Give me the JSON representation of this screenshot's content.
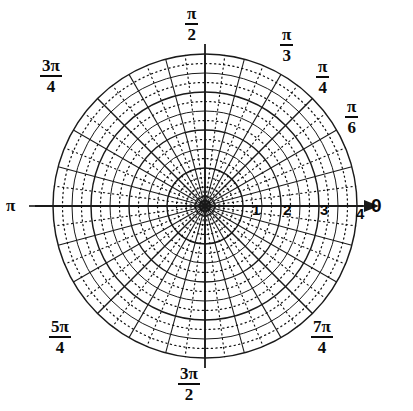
{
  "figure": {
    "kind": "polar-grid",
    "title": "",
    "background_color": "#ffffff",
    "line_color": "#1a1a1a",
    "dot_color": "#111111",
    "center_x": 205,
    "center_y": 206,
    "outer_radius_px": 152
  },
  "chart_data": {
    "type": "scatter",
    "title": "",
    "xlabel": "",
    "ylabel": "",
    "grid": true,
    "legend": null,
    "coordinate_system": "polar",
    "series": [],
    "x": [],
    "values": [],
    "radial_axis": {
      "label": "",
      "rlim": [
        0,
        4
      ],
      "major_ticks": [
        1,
        2,
        3,
        4
      ],
      "tick_labels": [
        "1",
        "2",
        "3",
        "4"
      ],
      "minor_solid_step": 0.5,
      "dotted_step": 0.25,
      "tick_label_angle_deg": 0
    },
    "angular_axis": {
      "label": "",
      "direction": "counterclockwise",
      "zero_location": "E",
      "solid_spoke_step": "pi/12",
      "dotted_spoke_step": "pi/24",
      "tick_labels": [
        "0",
        "pi/6",
        "pi/4",
        "pi/3",
        "pi/2",
        "3pi/4",
        "pi",
        "5pi/4",
        "3pi/2",
        "7pi/4"
      ]
    },
    "annotations": [
      {
        "name": "polar-axis-arrow",
        "text": "",
        "angle_deg": 0,
        "radius": 4.35
      }
    ]
  },
  "angle_labels": [
    {
      "id": "zero",
      "text": "0",
      "num": "",
      "den": "",
      "kind": "plain",
      "angle_deg": 0,
      "left": 371,
      "top": 196
    },
    {
      "id": "pi-over-6",
      "text": "",
      "num": "π",
      "den": "6",
      "kind": "fraction",
      "angle_deg": 30,
      "left": 345,
      "top": 98
    },
    {
      "id": "pi-over-4",
      "text": "",
      "num": "π",
      "den": "4",
      "kind": "fraction",
      "angle_deg": 45,
      "left": 316,
      "top": 58
    },
    {
      "id": "pi-over-3",
      "text": "",
      "num": "π",
      "den": "3",
      "kind": "fraction",
      "angle_deg": 60,
      "left": 280,
      "top": 26
    },
    {
      "id": "pi-over-2",
      "text": "",
      "num": "π",
      "den": "2",
      "kind": "fraction",
      "angle_deg": 90,
      "left": 185,
      "top": 5
    },
    {
      "id": "three-pi-over-4",
      "text": "",
      "num": "3π",
      "den": "4",
      "kind": "fraction",
      "angle_deg": 135,
      "left": 40,
      "top": 57
    },
    {
      "id": "pi",
      "text": "π",
      "num": "",
      "den": "",
      "kind": "plain",
      "angle_deg": 180,
      "left": 6,
      "top": 197
    },
    {
      "id": "five-pi-over-4",
      "text": "",
      "num": "5π",
      "den": "4",
      "kind": "fraction",
      "angle_deg": 225,
      "left": 49,
      "top": 318
    },
    {
      "id": "three-pi-over-2",
      "text": "",
      "num": "3π",
      "den": "2",
      "kind": "fraction",
      "angle_deg": 270,
      "left": 178,
      "top": 365
    },
    {
      "id": "seven-pi-over-4",
      "text": "",
      "num": "7π",
      "den": "4",
      "kind": "fraction",
      "angle_deg": 315,
      "left": 311,
      "top": 318
    }
  ],
  "radial_labels": [
    {
      "id": "r-1",
      "text": "1",
      "r": 1,
      "left": 252,
      "top": 202
    },
    {
      "id": "r-2",
      "text": "2",
      "r": 2,
      "left": 283,
      "top": 202
    },
    {
      "id": "r-3",
      "text": "3",
      "r": 3,
      "left": 320,
      "top": 202
    },
    {
      "id": "r-4",
      "text": "4",
      "r": 4,
      "left": 356,
      "top": 206
    }
  ]
}
